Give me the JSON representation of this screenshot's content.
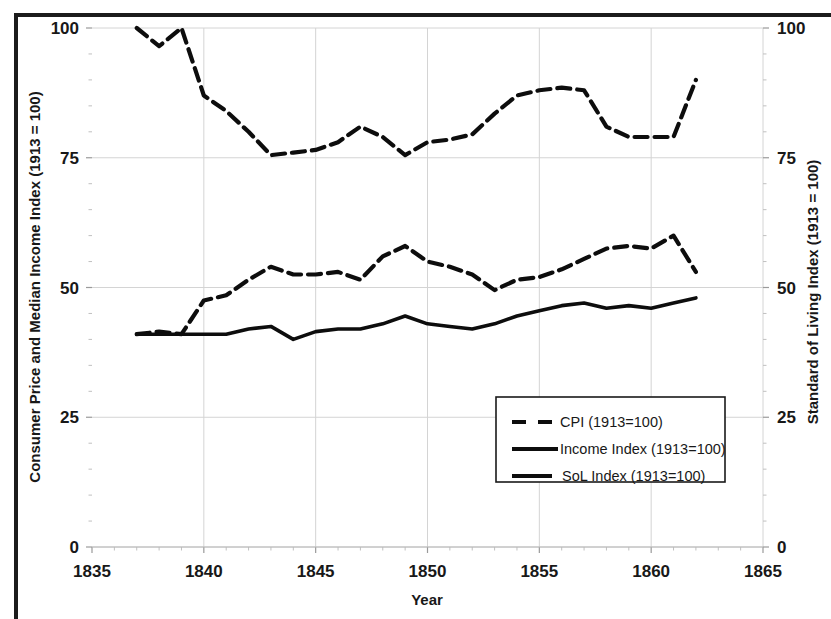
{
  "chart_data": {
    "type": "line",
    "title": "",
    "xlabel": "Year",
    "ylabel": "Consumer Price and Median Income Index (1913 = 100)",
    "y2label": "Standard of Living Index (1913 = 100)",
    "xlim": [
      1835,
      1865
    ],
    "ylim": [
      0,
      100
    ],
    "y2lim": [
      0,
      100
    ],
    "xticks": [
      1835,
      1840,
      1845,
      1850,
      1855,
      1860,
      1865
    ],
    "yticks": [
      0,
      25,
      50,
      75,
      100
    ],
    "y2ticks": [
      0,
      25,
      50,
      75,
      100
    ],
    "xtick_labels": [
      "1835",
      "1840",
      "1845",
      "1850",
      "1855",
      "1860",
      "1865"
    ],
    "ytick_labels": [
      "0",
      "25",
      "50",
      "75",
      "100"
    ],
    "y2tick_labels": [
      "0",
      "25",
      "50",
      "75",
      "100"
    ],
    "grid": true,
    "legend_position": "center-right",
    "x": [
      1837,
      1838,
      1839,
      1840,
      1841,
      1842,
      1843,
      1844,
      1845,
      1846,
      1847,
      1848,
      1849,
      1850,
      1851,
      1852,
      1853,
      1854,
      1855,
      1856,
      1857,
      1858,
      1859,
      1860,
      1861,
      1862
    ],
    "series": [
      {
        "name": "CPI (1913=100)",
        "style": "dashed",
        "axis": "left",
        "values": [
          100,
          96.5,
          100,
          87,
          84,
          80,
          75.5,
          76,
          76.5,
          78,
          81,
          79,
          75.5,
          78,
          78.5,
          79.5,
          83.5,
          87,
          88,
          88.5,
          88,
          81,
          79,
          79,
          79,
          90
        ]
      },
      {
        "name": "Income Index (1913=100)",
        "style": "dashed",
        "axis": "left",
        "values": [
          41,
          41.5,
          41,
          47.5,
          48.5,
          51.5,
          54,
          52.5,
          52.5,
          53,
          51.5,
          56,
          58,
          55,
          54,
          52.5,
          49.5,
          51.5,
          52,
          53.5,
          55.5,
          57.5,
          58,
          57.5,
          60,
          53
        ]
      },
      {
        "name": "SoL Index (1913=100)",
        "style": "solid",
        "axis": "right",
        "values": [
          41,
          41,
          41,
          41,
          41,
          42,
          42.5,
          40,
          41.5,
          42,
          42,
          43,
          44.5,
          43,
          42.5,
          42,
          43,
          44.5,
          45.5,
          46.5,
          47,
          46,
          46.5,
          46,
          47,
          48
        ]
      }
    ],
    "legend": [
      {
        "label": "CPI (1913=100)",
        "style": "dashed"
      },
      {
        "label": "Income Index (1913=100)",
        "style": "solid"
      },
      {
        "label": "SoL Index (1913=100)",
        "style": "solid"
      }
    ]
  }
}
